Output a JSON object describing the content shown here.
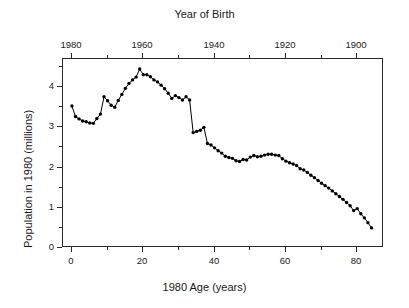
{
  "chart_data": {
    "type": "line",
    "title": "",
    "top_axis_title": "Year of Birth",
    "xlabel": "1980 Age (years)",
    "ylabel": "Population in 1980 (millions)",
    "xlim": [
      -2.5,
      87.5
    ],
    "ylim": [
      0,
      4.7
    ],
    "grid": false,
    "legend": null,
    "marker": "filled-circle",
    "line_color": "#000000",
    "xticks": [
      0,
      20,
      40,
      60,
      80
    ],
    "xtick_labels": [
      "0",
      "20",
      "40",
      "60",
      "80"
    ],
    "x_minor_ticks": [
      10,
      30,
      50,
      70
    ],
    "yticks": [
      0,
      1,
      2,
      3,
      4
    ],
    "ytick_labels": [
      "0",
      "1",
      "2",
      "3",
      "4"
    ],
    "y_minor_ticks": [
      0.5,
      1.5,
      2.5,
      3.5,
      4.5
    ],
    "top_xticks": [
      1980,
      1960,
      1940,
      1920,
      1900
    ],
    "top_xtick_labels": [
      "1980",
      "1960",
      "1940",
      "1920",
      "1900"
    ],
    "top_x_minor_ticks": [
      1970,
      1950,
      1930,
      1910
    ],
    "x": [
      0,
      1,
      2,
      3,
      4,
      5,
      6,
      7,
      8,
      9,
      10,
      11,
      12,
      13,
      14,
      15,
      16,
      17,
      18,
      19,
      20,
      21,
      22,
      23,
      24,
      25,
      26,
      27,
      28,
      29,
      30,
      31,
      32,
      33,
      34,
      35,
      36,
      37,
      38,
      39,
      40,
      41,
      42,
      43,
      44,
      45,
      46,
      47,
      48,
      49,
      50,
      51,
      52,
      53,
      54,
      55,
      56,
      57,
      58,
      59,
      60,
      61,
      62,
      63,
      64,
      65,
      66,
      67,
      68,
      69,
      70,
      71,
      72,
      73,
      74,
      75,
      76,
      77,
      78,
      79,
      80,
      81,
      82,
      83,
      84
    ],
    "values": [
      3.53,
      3.27,
      3.21,
      3.16,
      3.14,
      3.11,
      3.1,
      3.22,
      3.33,
      3.76,
      3.66,
      3.55,
      3.5,
      3.67,
      3.82,
      3.97,
      4.09,
      4.18,
      4.25,
      4.45,
      4.31,
      4.31,
      4.26,
      4.18,
      4.13,
      4.05,
      3.96,
      3.85,
      3.72,
      3.79,
      3.74,
      3.68,
      3.76,
      3.68,
      2.87,
      2.9,
      2.93,
      3.0,
      2.6,
      2.56,
      2.49,
      2.42,
      2.36,
      2.28,
      2.25,
      2.23,
      2.17,
      2.15,
      2.2,
      2.19,
      2.26,
      2.3,
      2.27,
      2.28,
      2.31,
      2.33,
      2.33,
      2.31,
      2.3,
      2.22,
      2.16,
      2.12,
      2.09,
      2.05,
      1.97,
      1.94,
      1.88,
      1.81,
      1.75,
      1.68,
      1.61,
      1.55,
      1.49,
      1.42,
      1.35,
      1.28,
      1.21,
      1.13,
      1.05,
      0.93,
      0.98,
      0.85,
      0.75,
      0.63,
      0.5
    ],
    "series_name": "US population in 1980 by single year of age"
  }
}
